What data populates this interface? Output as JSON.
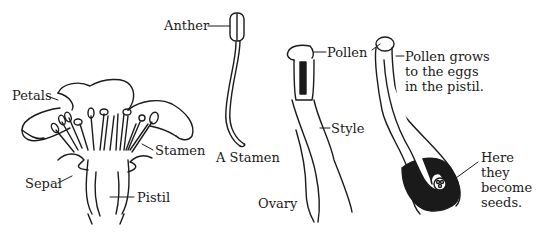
{
  "diagram": {
    "type": "botanical-illustration",
    "panels": [
      {
        "id": "flower",
        "labels": [
          "Petals",
          "Stamen",
          "Sepal",
          "Pistil"
        ]
      },
      {
        "id": "single-stamen",
        "caption": "A Stamen",
        "labels": [
          "Anther"
        ]
      },
      {
        "id": "pistil-with-pollen",
        "labels": [
          "Pollen",
          "Style",
          "Ovary"
        ]
      },
      {
        "id": "pollen-tube",
        "labels": [
          "Pollen grows to the eggs in the pistil.",
          "Here they become seeds."
        ]
      }
    ]
  },
  "labels": {
    "petals": "Petals",
    "stamen": "Stamen",
    "sepal": "Sepal",
    "pistil": "Pistil",
    "anther": "Anther",
    "a_stamen": "A Stamen",
    "pollen": "Pollen",
    "style": "Style",
    "ovary": "Ovary",
    "pollen_grows": [
      "Pollen grows",
      "to the eggs",
      "in the pistil."
    ],
    "here_seeds": [
      "Here",
      "they",
      "become",
      "seeds."
    ]
  },
  "colors": {
    "ink": "#1a1a1a",
    "background": "#ffffff"
  }
}
